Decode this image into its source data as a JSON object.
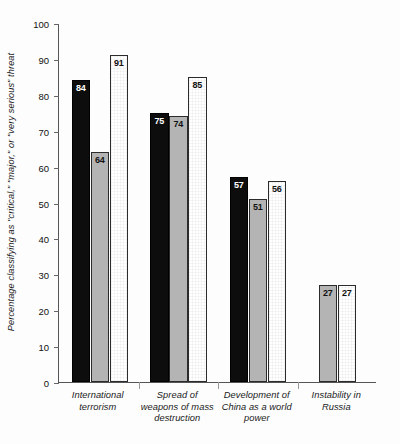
{
  "chart_data": {
    "type": "bar",
    "title": "",
    "subtitle": "",
    "xlabel": "",
    "ylabel": "Percentage classifying as \"critical,\" \"major,\" or \"very serious\" threat",
    "ylim": [
      0,
      100
    ],
    "ytick_step": 10,
    "yticks": [
      100,
      90,
      80,
      70,
      60,
      50,
      40,
      30,
      20,
      10,
      0
    ],
    "grid": false,
    "legend": "none",
    "categories": [
      "International terrorism",
      "Spread of weapons of mass destruction",
      "Development of China as a world power",
      "Instability in Russia"
    ],
    "category_lines": [
      [
        "International",
        "terrorism"
      ],
      [
        "Spread of",
        "weapons of mass",
        "destruction"
      ],
      [
        "Development of",
        "China as a world",
        "power"
      ],
      [
        "Instability in",
        "Russia"
      ]
    ],
    "series": [
      {
        "name": "black",
        "style": "black",
        "values": [
          84,
          75,
          57,
          null
        ]
      },
      {
        "name": "gray",
        "style": "gray",
        "values": [
          64,
          74,
          51,
          27
        ]
      },
      {
        "name": "white",
        "style": "white",
        "values": [
          91,
          85,
          56,
          27
        ]
      }
    ]
  },
  "colors": {
    "black_bar": "#0d0d0d",
    "gray_bar": "#b4b4b4",
    "white_bar": "#ffffff",
    "bar_border": "#2b2b2b",
    "axis": "#555555",
    "text": "#1a1a1a",
    "background": "#fdfdfd"
  }
}
